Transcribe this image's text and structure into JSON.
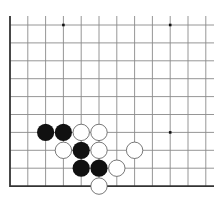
{
  "diagram": {
    "type": "go-board-fragment",
    "grid": {
      "cols_x": [
        10,
        27.8,
        45.6,
        63.4,
        81.2,
        99,
        116.8,
        134.6,
        152.4,
        170.2,
        188,
        205.8
      ],
      "rows_y": [
        25,
        42.9,
        60.8,
        78.7,
        96.6,
        114.5,
        132.4,
        150.3,
        168.2,
        186.1
      ],
      "right_extent": 214,
      "top_extent": 16,
      "line_color": "#8a8a8a",
      "edge_color": "#333333"
    },
    "star_points": [
      {
        "col": 3,
        "row": 0
      },
      {
        "col": 9,
        "row": 0
      },
      {
        "col": 9,
        "row": 6
      }
    ],
    "stones": [
      {
        "color": "black",
        "col": 2,
        "row": 6
      },
      {
        "color": "black",
        "col": 3,
        "row": 6
      },
      {
        "color": "white",
        "col": 4,
        "row": 6
      },
      {
        "color": "white",
        "col": 5,
        "row": 6
      },
      {
        "color": "white",
        "col": 3,
        "row": 7
      },
      {
        "color": "black",
        "col": 4,
        "row": 7
      },
      {
        "color": "white",
        "col": 5,
        "row": 7
      },
      {
        "color": "white",
        "col": 7,
        "row": 7
      },
      {
        "color": "black",
        "col": 4,
        "row": 8
      },
      {
        "color": "black",
        "col": 5,
        "row": 8
      },
      {
        "color": "white",
        "col": 6,
        "row": 8
      },
      {
        "color": "white",
        "col": 5,
        "row": 9
      }
    ],
    "colors": {
      "black_stone": "#111111",
      "white_stone_fill": "#ffffff",
      "white_stone_stroke": "#555555"
    }
  }
}
